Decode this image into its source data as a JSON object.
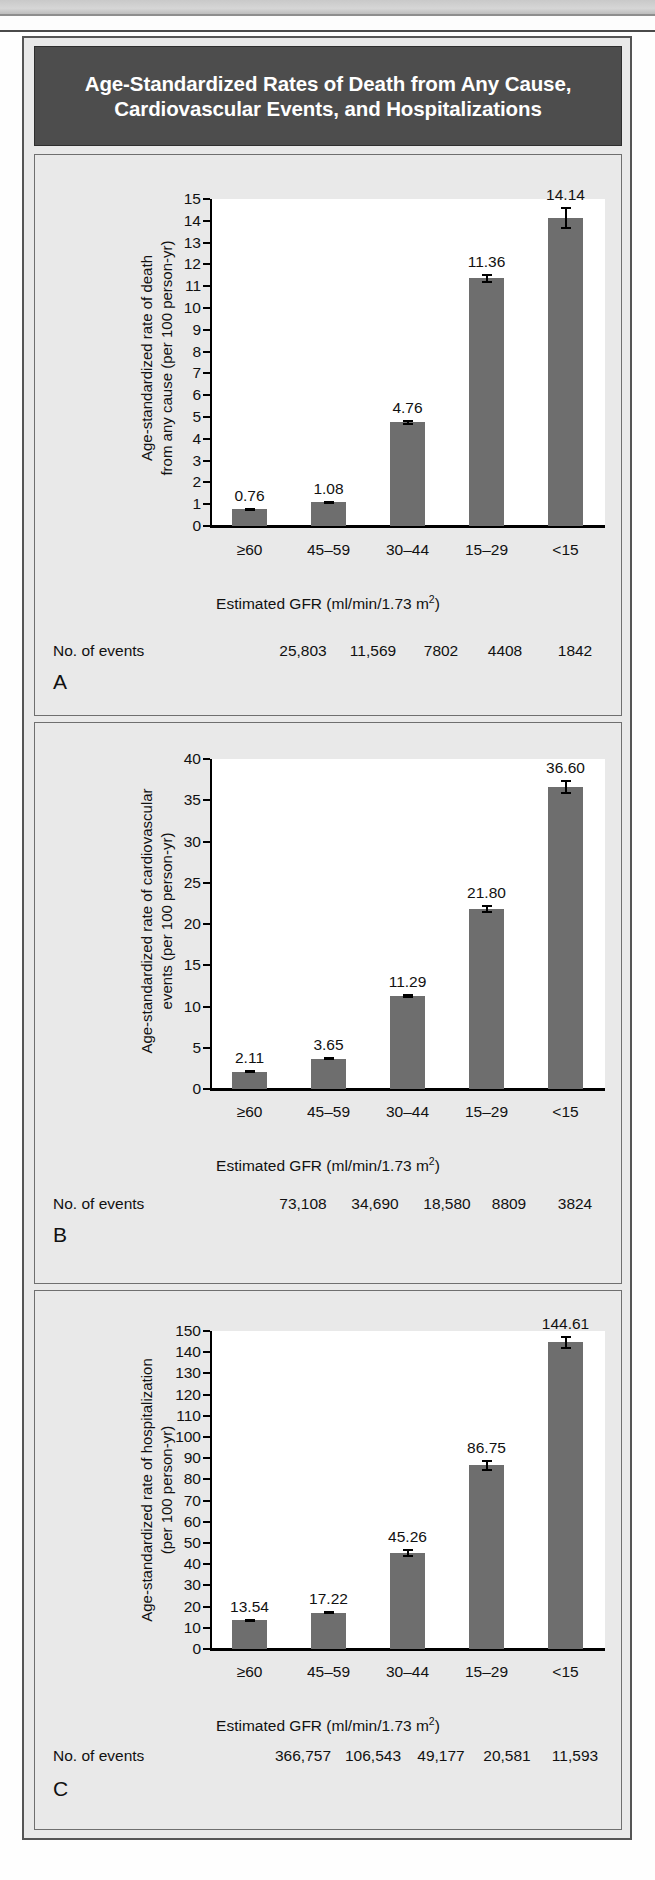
{
  "figure": {
    "title": "Age-Standardized Rates of Death from Any Cause, Cardiovascular Events, and Hospitalizations",
    "events_label": "No. of events",
    "xtitle_main": "Estimated GFR (ml/min/1.73 m",
    "xtitle_sup": "2",
    "xtitle_tail": ")",
    "categories": [
      "≥60",
      "45–59",
      "30–44",
      "15–29",
      "<15"
    ],
    "colors": {
      "bar": "#6e6e6e",
      "banner": "#4d4d4d",
      "panel_bg": "#e9e9e9",
      "plot_bg": "#ffffff",
      "axis": "#000000"
    }
  },
  "chart_data": [
    {
      "panel": "A",
      "type": "bar",
      "title": "",
      "ylabel_line1": "Age-standardized rate of death",
      "ylabel_line2": "from any cause (per 100 person-yr)",
      "xlabel": "Estimated GFR (ml/min/1.73 m2)",
      "categories": [
        "≥60",
        "45–59",
        "30–44",
        "15–29",
        "<15"
      ],
      "values": [
        0.76,
        1.08,
        4.76,
        11.36,
        14.14
      ],
      "value_labels": [
        "0.76",
        "1.08",
        "4.76",
        "11.36",
        "14.14"
      ],
      "errors": [
        0.06,
        0.07,
        0.12,
        0.22,
        0.5
      ],
      "ylim": [
        0,
        15
      ],
      "yticks": [
        0,
        1,
        2,
        3,
        4,
        5,
        6,
        7,
        8,
        9,
        10,
        11,
        12,
        13,
        14,
        15
      ],
      "ytick_labels": [
        "0",
        "1",
        "2",
        "3",
        "4",
        "5",
        "6",
        "7",
        "8",
        "9",
        "10",
        "11",
        "12",
        "13",
        "14",
        "15"
      ],
      "grid": false,
      "legend": "none",
      "events": [
        "25,803",
        "11,569",
        "7802",
        "4408",
        "1842"
      ]
    },
    {
      "panel": "B",
      "type": "bar",
      "title": "",
      "ylabel_line1": "Age-standardized rate of cardiovascular",
      "ylabel_line2": "events (per 100 person-yr)",
      "xlabel": "Estimated GFR (ml/min/1.73 m2)",
      "categories": [
        "≥60",
        "45–59",
        "30–44",
        "15–29",
        "<15"
      ],
      "values": [
        2.11,
        3.65,
        11.29,
        21.8,
        36.6
      ],
      "value_labels": [
        "2.11",
        "3.65",
        "11.29",
        "21.80",
        "36.60"
      ],
      "errors": [
        0.15,
        0.18,
        0.2,
        0.5,
        0.9
      ],
      "ylim": [
        0,
        40
      ],
      "yticks": [
        0,
        5,
        10,
        15,
        20,
        25,
        30,
        35,
        40
      ],
      "ytick_labels": [
        "0",
        "5",
        "10",
        "15",
        "20",
        "25",
        "30",
        "35",
        "40"
      ],
      "grid": false,
      "legend": "none",
      "events": [
        "73,108",
        "34,690",
        "18,580",
        "8809",
        "3824"
      ]
    },
    {
      "panel": "C",
      "type": "bar",
      "title": "",
      "ylabel_line1": "Age-standardized rate of hospitalization",
      "ylabel_line2": "(per 100 person-yr)",
      "xlabel": "Estimated GFR (ml/min/1.73 m2)",
      "categories": [
        "≥60",
        "45–59",
        "30–44",
        "15–29",
        "<15"
      ],
      "values": [
        13.54,
        17.22,
        45.26,
        86.75,
        144.61
      ],
      "value_labels": [
        "13.54",
        "17.22",
        "45.26",
        "86.75",
        "144.61"
      ],
      "errors": [
        0.7,
        0.9,
        2.0,
        2.6,
        3.2
      ],
      "ylim": [
        0,
        150
      ],
      "yticks": [
        0,
        10,
        20,
        30,
        40,
        50,
        60,
        70,
        80,
        90,
        100,
        110,
        120,
        130,
        140,
        150
      ],
      "ytick_labels": [
        "0",
        "10",
        "20",
        "30",
        "40",
        "50",
        "60",
        "70",
        "80",
        "90",
        "100",
        "110",
        "120",
        "130",
        "140",
        "150"
      ],
      "grid": false,
      "legend": "none",
      "events": [
        "366,757",
        "106,543",
        "49,177",
        "20,581",
        "11,593"
      ]
    }
  ]
}
